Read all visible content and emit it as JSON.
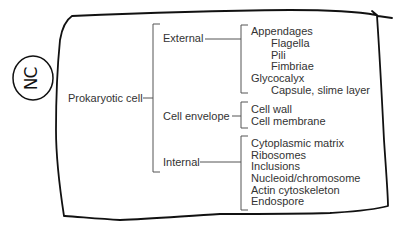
{
  "diagram": {
    "annotation": "NC",
    "root": "Prokaryotic cell",
    "groups": [
      {
        "label": "External",
        "items": [
          {
            "label": "Appendages",
            "level": 0
          },
          {
            "label": "Flagella",
            "level": 1
          },
          {
            "label": "Pili",
            "level": 1
          },
          {
            "label": "Fimbriae",
            "level": 1
          },
          {
            "label": "Glycocalyx",
            "level": 0
          },
          {
            "label": "Capsule, slime layer",
            "level": 1
          }
        ]
      },
      {
        "label": "Cell envelope",
        "items": [
          {
            "label": "Cell wall",
            "level": 0
          },
          {
            "label": "Cell membrane",
            "level": 0
          }
        ]
      },
      {
        "label": "Internal",
        "items": [
          {
            "label": "Cytoplasmic matrix",
            "level": 0
          },
          {
            "label": "Ribosomes",
            "level": 0
          },
          {
            "label": "Inclusions",
            "level": 0
          },
          {
            "label": "Nucleoid/chromosome",
            "level": 0
          },
          {
            "label": "Actin cytoskeleton",
            "level": 0
          },
          {
            "label": "Endospore",
            "level": 0
          }
        ]
      }
    ],
    "colors": {
      "ink": "#111111",
      "bracket": "#555555",
      "text": "#333333"
    }
  }
}
